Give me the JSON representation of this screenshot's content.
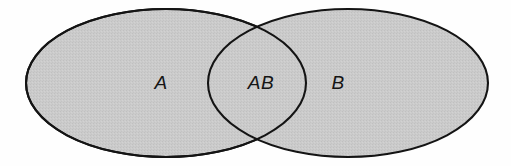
{
  "figure": {
    "type": "venn-diagram",
    "background_color": "#fefefe",
    "fill_color": "#c9c9c9",
    "stroke_color": "#141414",
    "stroke_width": 2.1,
    "canvas": {
      "width": 511,
      "height": 166
    }
  },
  "sets": [
    {
      "id": "set-a",
      "label": "A",
      "region": "left-only",
      "label_x": 161,
      "label_y": 89,
      "ellipse": {
        "cx": 166,
        "cy": 83,
        "rx": 140,
        "ry": 74
      }
    },
    {
      "id": "set-ab",
      "label": "AB",
      "region": "intersection",
      "label_x": 261,
      "label_y": 89
    },
    {
      "id": "set-b",
      "label": "B",
      "region": "right-only",
      "label_x": 338,
      "label_y": 89,
      "ellipse": {
        "cx": 348,
        "cy": 83,
        "rx": 140,
        "ry": 74
      }
    }
  ],
  "intersection": {
    "top_crossing": {
      "x": 257,
      "y": 27
    },
    "bottom_crossing": {
      "x": 257,
      "y": 140
    },
    "left_extent": 208,
    "right_extent": 306
  }
}
